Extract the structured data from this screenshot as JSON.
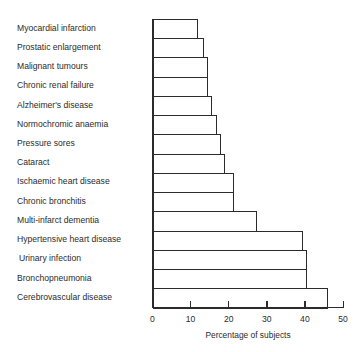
{
  "chart_data": {
    "type": "bar",
    "orientation": "horizontal",
    "title": "",
    "xlabel": "Percentage of subjects",
    "ylabel": "",
    "xlim": [
      0,
      50
    ],
    "xticks": [
      0,
      10,
      20,
      30,
      40,
      50
    ],
    "grid": false,
    "legend": null,
    "categories": [
      "Myocardial infarction",
      "Prostatic enlargement",
      "Malignant tumours",
      "Chronic renal failure",
      "Alzheimer's disease",
      "Normochromic anaemia",
      "Pressure sores",
      "Cataract",
      "Ischaemic heart disease",
      "Chronic bronchitis",
      "Multi-infarct dementia",
      "Hypertensive heart disease",
      "Urinary infection",
      "Bronchopneumonia",
      "Cerebrovascular disease"
    ],
    "values": [
      12,
      13.5,
      14.5,
      14.5,
      15.5,
      17,
      18,
      19,
      21.5,
      21.5,
      27.5,
      39.5,
      40.5,
      40.5,
      46
    ]
  },
  "colors": {
    "bar_fill": "#ffffff",
    "bar_stroke": "#2b2b2b",
    "text": "#2b2b2b"
  }
}
